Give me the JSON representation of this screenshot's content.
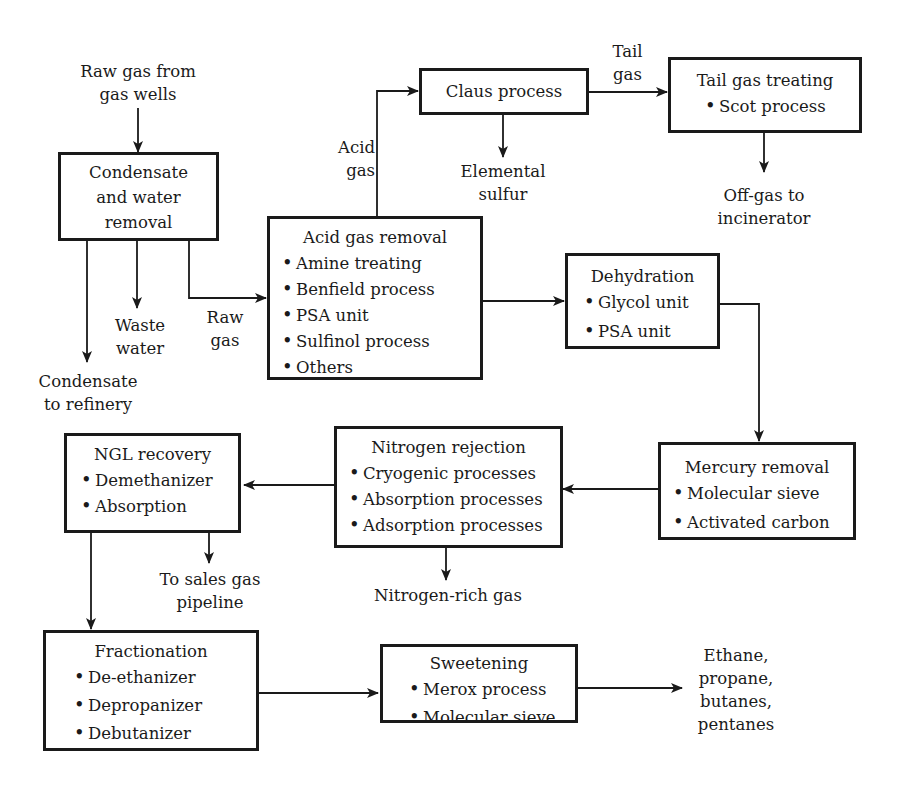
{
  "diagram": {
    "type": "process-flow"
  },
  "labels": {
    "raw_gas_source_1": "Raw gas from",
    "raw_gas_source_2": "gas wells",
    "acid_gas_1": "Acid",
    "acid_gas_2": "gas",
    "tail_gas_1": "Tail",
    "tail_gas_2": "gas",
    "elemental_sulfur_1": "Elemental",
    "elemental_sulfur_2": "sulfur",
    "offgas_1": "Off-gas to",
    "offgas_2": "incinerator",
    "waste_water_1": "Waste",
    "waste_water_2": "water",
    "raw_gas_1": "Raw",
    "raw_gas_2": "gas",
    "condensate_refinery_1": "Condensate",
    "condensate_refinery_2": "to refinery",
    "sales_gas_1": "To sales gas",
    "sales_gas_2": "pipeline",
    "nitrogen_rich": "Nitrogen-rich gas",
    "products_1": "Ethane,",
    "products_2": "propane,",
    "products_3": "butanes,",
    "products_4": "pentanes"
  },
  "nodes": {
    "condensate": {
      "title_lines": [
        "Condensate",
        "and water",
        "removal"
      ]
    },
    "claus": {
      "title": "Claus process"
    },
    "tailgas": {
      "title": "Tail gas treating",
      "items": [
        "Scot process"
      ]
    },
    "acidgas": {
      "title": "Acid gas removal",
      "items": [
        "Amine treating",
        "Benfield process",
        "PSA unit",
        "Sulfinol process",
        "Others"
      ]
    },
    "dehydration": {
      "title": "Dehydration",
      "items": [
        "Glycol unit",
        "PSA unit"
      ]
    },
    "mercury": {
      "title": "Mercury removal",
      "items": [
        "Molecular sieve",
        "Activated carbon"
      ]
    },
    "nitrogen": {
      "title": "Nitrogen rejection",
      "items": [
        "Cryogenic processes",
        "Absorption processes",
        "Adsorption processes"
      ]
    },
    "ngl": {
      "title": "NGL recovery",
      "items": [
        "Demethanizer",
        "Absorption"
      ]
    },
    "fractionation": {
      "title": "Fractionation",
      "items": [
        "De-ethanizer",
        "Depropanizer",
        "Debutanizer"
      ]
    },
    "sweetening": {
      "title": "Sweetening",
      "items": [
        "Merox process",
        "Molecular sieve"
      ]
    }
  },
  "edges": [
    {
      "from": "raw gas from gas wells",
      "to": "condensate"
    },
    {
      "from": "condensate",
      "to": "condensate to refinery"
    },
    {
      "from": "condensate",
      "to": "waste water"
    },
    {
      "from": "condensate",
      "to": "acidgas",
      "label": "Raw gas"
    },
    {
      "from": "acidgas",
      "to": "claus",
      "label": "Acid gas"
    },
    {
      "from": "claus",
      "to": "elemental sulfur"
    },
    {
      "from": "claus",
      "to": "tailgas",
      "label": "Tail gas"
    },
    {
      "from": "tailgas",
      "to": "off-gas to incinerator"
    },
    {
      "from": "acidgas",
      "to": "dehydration"
    },
    {
      "from": "dehydration",
      "to": "mercury"
    },
    {
      "from": "mercury",
      "to": "nitrogen"
    },
    {
      "from": "nitrogen",
      "to": "nitrogen-rich gas"
    },
    {
      "from": "nitrogen",
      "to": "ngl"
    },
    {
      "from": "ngl",
      "to": "to sales gas pipeline"
    },
    {
      "from": "ngl",
      "to": "fractionation"
    },
    {
      "from": "fractionation",
      "to": "sweetening"
    },
    {
      "from": "sweetening",
      "to": "ethane, propane, butanes, pentanes"
    }
  ],
  "colors": {
    "ink": "#1a1a1a",
    "background": "#ffffff"
  }
}
